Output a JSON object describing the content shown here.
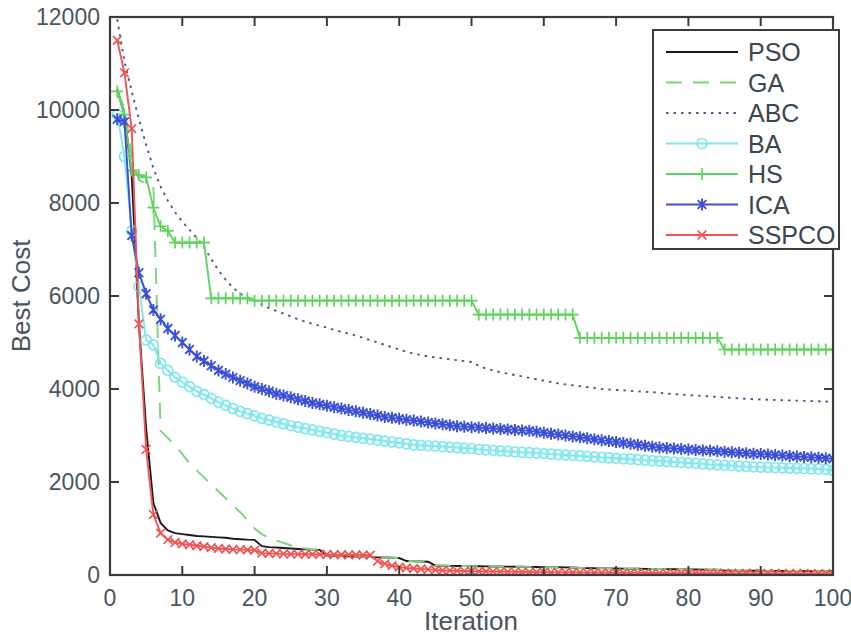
{
  "chart_data": {
    "type": "line",
    "title": "",
    "xlabel": "Iteration",
    "ylabel": "Best Cost",
    "xlim": [
      0,
      100
    ],
    "ylim": [
      0,
      12000
    ],
    "xticks": [
      0,
      10,
      20,
      30,
      40,
      50,
      60,
      70,
      80,
      90,
      100
    ],
    "yticks": [
      0,
      2000,
      4000,
      6000,
      8000,
      10000,
      12000
    ],
    "grid": false,
    "legend_position": "upper right",
    "x": [
      1,
      2,
      3,
      4,
      5,
      6,
      7,
      8,
      9,
      10,
      11,
      12,
      13,
      14,
      15,
      16,
      17,
      18,
      19,
      20,
      21,
      22,
      23,
      24,
      25,
      26,
      27,
      28,
      29,
      30,
      31,
      32,
      33,
      34,
      35,
      36,
      37,
      38,
      39,
      40,
      41,
      42,
      43,
      44,
      45,
      46,
      47,
      48,
      49,
      50,
      51,
      52,
      53,
      54,
      55,
      56,
      57,
      58,
      59,
      60,
      61,
      62,
      63,
      64,
      65,
      66,
      67,
      68,
      69,
      70,
      71,
      72,
      73,
      74,
      75,
      76,
      77,
      78,
      79,
      80,
      81,
      82,
      83,
      84,
      85,
      86,
      87,
      88,
      89,
      90,
      91,
      92,
      93,
      94,
      95,
      96,
      97,
      98,
      99,
      100
    ],
    "series": [
      {
        "name": "PSO",
        "color": "#1a1a1a",
        "style": "solid",
        "marker": "none",
        "values": [
          10450,
          9900,
          8600,
          5400,
          3150,
          1550,
          1120,
          960,
          900,
          880,
          860,
          840,
          830,
          820,
          810,
          800,
          780,
          770,
          760,
          755,
          620,
          600,
          590,
          580,
          570,
          560,
          550,
          545,
          540,
          420,
          410,
          405,
          400,
          395,
          390,
          385,
          380,
          375,
          370,
          365,
          300,
          295,
          290,
          285,
          200,
          198,
          196,
          194,
          192,
          190,
          188,
          186,
          184,
          182,
          180,
          178,
          176,
          174,
          172,
          170,
          168,
          166,
          164,
          162,
          150,
          148,
          146,
          144,
          142,
          140,
          138,
          136,
          134,
          132,
          130,
          128,
          126,
          124,
          122,
          120,
          118,
          116,
          114,
          112,
          95,
          94,
          93,
          92,
          91,
          90,
          89,
          88,
          87,
          86,
          85,
          84,
          83,
          82,
          81,
          80
        ]
      },
      {
        "name": "GA",
        "color": "#7ad47a",
        "style": "dashed",
        "marker": "none",
        "values": [
          10400,
          10050,
          9000,
          8500,
          8400,
          8350,
          3100,
          2950,
          2780,
          2600,
          2400,
          2250,
          2100,
          1950,
          1800,
          1650,
          1500,
          1350,
          1180,
          1000,
          880,
          800,
          740,
          690,
          640,
          600,
          570,
          545,
          525,
          430,
          420,
          410,
          402,
          396,
          390,
          385,
          380,
          375,
          370,
          365,
          302,
          298,
          294,
          290,
          205,
          202,
          199,
          196,
          193,
          191,
          189,
          187,
          185,
          183,
          181,
          179,
          177,
          175,
          173,
          171,
          169,
          167,
          165,
          163,
          151,
          149,
          147,
          145,
          143,
          141,
          139,
          137,
          135,
          133,
          131,
          129,
          127,
          125,
          123,
          121,
          119,
          117,
          115,
          113,
          97,
          96,
          95,
          94,
          93,
          92,
          91,
          90,
          89,
          88,
          87,
          86,
          85,
          84,
          83,
          82
        ]
      },
      {
        "name": "ABC",
        "color": "#4a5a8a",
        "style": "dotted",
        "marker": "none",
        "values": [
          11950,
          11050,
          10400,
          9800,
          9250,
          8750,
          8350,
          8050,
          7800,
          7600,
          7420,
          7250,
          7050,
          6800,
          6550,
          6350,
          6180,
          6050,
          5970,
          5900,
          5820,
          5740,
          5680,
          5620,
          5560,
          5500,
          5450,
          5400,
          5360,
          5320,
          5270,
          5230,
          5190,
          5150,
          5100,
          5050,
          5000,
          4950,
          4900,
          4850,
          4800,
          4760,
          4730,
          4700,
          4680,
          4660,
          4640,
          4620,
          4600,
          4580,
          4500,
          4440,
          4400,
          4360,
          4330,
          4300,
          4270,
          4240,
          4210,
          4180,
          4150,
          4120,
          4100,
          4080,
          4060,
          4040,
          4020,
          4000,
          3990,
          3980,
          3970,
          3960,
          3950,
          3940,
          3930,
          3920,
          3900,
          3890,
          3880,
          3870,
          3860,
          3850,
          3840,
          3830,
          3820,
          3810,
          3800,
          3790,
          3780,
          3775,
          3770,
          3765,
          3760,
          3755,
          3750,
          3745,
          3740,
          3735,
          3730,
          3720
        ]
      },
      {
        "name": "BA",
        "color": "#7fe8ee",
        "style": "solid",
        "marker": "circle",
        "values": [
          9900,
          9000,
          7400,
          6200,
          5050,
          4950,
          4550,
          4400,
          4250,
          4150,
          4050,
          3950,
          3880,
          3800,
          3720,
          3650,
          3580,
          3520,
          3470,
          3420,
          3370,
          3330,
          3290,
          3250,
          3210,
          3180,
          3150,
          3120,
          3090,
          3060,
          3030,
          3000,
          2980,
          2960,
          2940,
          2920,
          2900,
          2880,
          2860,
          2840,
          2820,
          2800,
          2790,
          2780,
          2770,
          2760,
          2750,
          2740,
          2730,
          2720,
          2700,
          2690,
          2680,
          2670,
          2660,
          2650,
          2640,
          2630,
          2620,
          2610,
          2600,
          2590,
          2580,
          2570,
          2560,
          2550,
          2540,
          2530,
          2520,
          2510,
          2500,
          2490,
          2480,
          2470,
          2460,
          2450,
          2440,
          2430,
          2420,
          2410,
          2400,
          2390,
          2380,
          2370,
          2360,
          2350,
          2340,
          2330,
          2325,
          2320,
          2315,
          2310,
          2305,
          2300,
          2295,
          2290,
          2285,
          2280,
          2270,
          2250
        ]
      },
      {
        "name": "HS",
        "color": "#5fd35f",
        "style": "solid",
        "marker": "plus",
        "values": [
          10400,
          9900,
          8700,
          8600,
          8550,
          7900,
          7500,
          7400,
          7150,
          7150,
          7150,
          7150,
          7150,
          5950,
          5950,
          5950,
          5950,
          5950,
          5950,
          5900,
          5900,
          5900,
          5900,
          5900,
          5900,
          5900,
          5900,
          5900,
          5900,
          5900,
          5900,
          5900,
          5900,
          5900,
          5900,
          5900,
          5900,
          5900,
          5900,
          5900,
          5900,
          5900,
          5900,
          5900,
          5900,
          5900,
          5900,
          5900,
          5900,
          5900,
          5600,
          5600,
          5600,
          5600,
          5600,
          5600,
          5600,
          5600,
          5600,
          5600,
          5600,
          5600,
          5600,
          5600,
          5100,
          5100,
          5100,
          5100,
          5100,
          5100,
          5100,
          5100,
          5100,
          5100,
          5100,
          5100,
          5100,
          5100,
          5100,
          5100,
          5100,
          5100,
          5100,
          5100,
          4850,
          4850,
          4850,
          4850,
          4850,
          4850,
          4850,
          4850,
          4850,
          4850,
          4850,
          4850,
          4850,
          4850,
          4850,
          4850
        ]
      },
      {
        "name": "ICA",
        "color": "#3a4fd8",
        "style": "solid",
        "marker": "asterisk",
        "values": [
          9800,
          9750,
          7300,
          6500,
          6050,
          5700,
          5500,
          5300,
          5150,
          5000,
          4850,
          4700,
          4600,
          4500,
          4400,
          4320,
          4250,
          4180,
          4120,
          4050,
          4000,
          3950,
          3900,
          3860,
          3820,
          3780,
          3740,
          3700,
          3670,
          3640,
          3610,
          3580,
          3550,
          3520,
          3490,
          3460,
          3430,
          3400,
          3380,
          3360,
          3340,
          3320,
          3300,
          3280,
          3260,
          3240,
          3220,
          3200,
          3190,
          3180,
          3170,
          3160,
          3150,
          3140,
          3130,
          3120,
          3110,
          3100,
          3080,
          3060,
          3040,
          3020,
          3000,
          2980,
          2960,
          2940,
          2920,
          2900,
          2880,
          2860,
          2840,
          2820,
          2800,
          2780,
          2760,
          2740,
          2730,
          2720,
          2710,
          2700,
          2690,
          2680,
          2670,
          2660,
          2650,
          2640,
          2630,
          2620,
          2610,
          2600,
          2590,
          2580,
          2570,
          2560,
          2550,
          2540,
          2530,
          2520,
          2510,
          2500
        ]
      },
      {
        "name": "SSPCO",
        "color": "#ee5555",
        "style": "solid",
        "marker": "x",
        "values": [
          11500,
          10800,
          9600,
          5400,
          2700,
          1300,
          900,
          760,
          700,
          670,
          650,
          630,
          610,
          590,
          570,
          560,
          550,
          545,
          540,
          535,
          470,
          465,
          460,
          455,
          450,
          448,
          446,
          444,
          442,
          440,
          438,
          436,
          434,
          432,
          430,
          428,
          300,
          240,
          200,
          170,
          150,
          140,
          130,
          120,
          110,
          100,
          95,
          90,
          85,
          80,
          78,
          76,
          74,
          72,
          70,
          68,
          66,
          64,
          62,
          60,
          58,
          56,
          55,
          54,
          53,
          52,
          51,
          50,
          49,
          48,
          47,
          46,
          45,
          44,
          43,
          42,
          41,
          40,
          40,
          39,
          39,
          38,
          38,
          37,
          37,
          36,
          36,
          35,
          35,
          34,
          34,
          33,
          33,
          32,
          32,
          31,
          31,
          30,
          30,
          30
        ]
      }
    ]
  },
  "legend": {
    "items": [
      {
        "label": "PSO"
      },
      {
        "label": "GA"
      },
      {
        "label": "ABC"
      },
      {
        "label": "BA"
      },
      {
        "label": "HS"
      },
      {
        "label": "ICA"
      },
      {
        "label": "SSPCO"
      }
    ]
  }
}
